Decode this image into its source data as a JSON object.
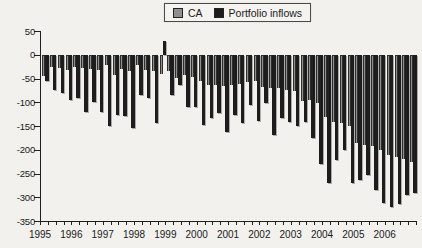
{
  "figure": {
    "legend": {
      "items": [
        {
          "label": "CA",
          "color": "#8f8f8f"
        },
        {
          "label": "Portfolio inflows",
          "color": "#1c1c1c"
        }
      ]
    }
  },
  "chart_data": {
    "type": "bar",
    "title": "",
    "grid": false,
    "legend_position": "top-center",
    "ylim": [
      -350,
      50
    ],
    "yticks": [
      50,
      0,
      -50,
      -100,
      -150,
      -200,
      -250,
      -300,
      -350
    ],
    "year_labels": [
      "1995",
      "1996",
      "1997",
      "1998",
      "1999",
      "2000",
      "2001",
      "2002",
      "2003",
      "2004",
      "2005",
      "2006"
    ],
    "categories": [
      "1995Q1",
      "1995Q2",
      "1995Q3",
      "1995Q4",
      "1996Q1",
      "1996Q2",
      "1996Q3",
      "1996Q4",
      "1997Q1",
      "1997Q2",
      "1997Q3",
      "1997Q4",
      "1998Q1",
      "1998Q2",
      "1998Q3",
      "1998Q4",
      "1999Q1",
      "1999Q2",
      "1999Q3",
      "1999Q4",
      "2000Q1",
      "2000Q2",
      "2000Q3",
      "2000Q4",
      "2001Q1",
      "2001Q2",
      "2001Q3",
      "2001Q4",
      "2002Q1",
      "2002Q2",
      "2002Q3",
      "2002Q4",
      "2003Q1",
      "2003Q2",
      "2003Q3",
      "2003Q4",
      "2004Q1",
      "2004Q2",
      "2004Q3",
      "2004Q4",
      "2005Q1",
      "2005Q2",
      "2005Q3",
      "2005Q4",
      "2006Q1",
      "2006Q2",
      "2006Q3",
      "2006Q4"
    ],
    "series": [
      {
        "name": "CA",
        "color": "#8f8f8f",
        "values": [
          -45,
          -25,
          -28,
          -32,
          -25,
          -27,
          -29,
          -32,
          -22,
          -42,
          -29,
          -35,
          -21,
          -32,
          -35,
          -40,
          -35,
          -49,
          -42,
          -46,
          -56,
          -63,
          -63,
          -65,
          -63,
          -61,
          -58,
          -55,
          -67,
          -69,
          -71,
          -74,
          -77,
          -98,
          -95,
          -101,
          -130,
          -141,
          -143,
          -151,
          -186,
          -190,
          -193,
          -200,
          -210,
          -215,
          -220,
          -225
        ]
      },
      {
        "name": "Portfolio inflows",
        "color": "#1c1c1c",
        "values": [
          -55,
          -74,
          -81,
          -95,
          -91,
          -120,
          -100,
          -120,
          -151,
          -127,
          -129,
          -154,
          -84,
          -91,
          -143,
          30,
          -84,
          -63,
          -109,
          -111,
          -148,
          -134,
          -123,
          -162,
          -127,
          -144,
          -105,
          -139,
          -102,
          -169,
          -134,
          -141,
          -151,
          -141,
          -176,
          -230,
          -270,
          -221,
          -200,
          -271,
          -264,
          -253,
          -285,
          -313,
          -320,
          -315,
          -295,
          -290
        ]
      }
    ]
  }
}
